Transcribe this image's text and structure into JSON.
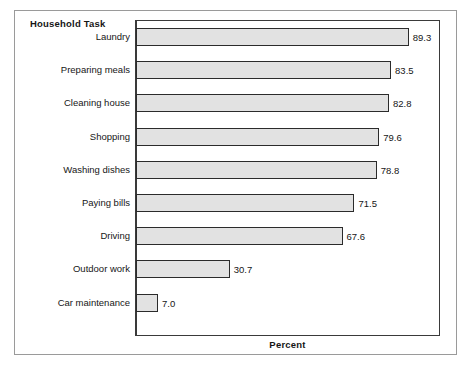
{
  "chart_data": {
    "type": "bar",
    "orientation": "horizontal",
    "title": "",
    "group_title": "Household Task",
    "xlabel": "Percent",
    "ylabel": "",
    "categories": [
      "Laundry",
      "Preparing meals",
      "Cleaning house",
      "Shopping",
      "Washing dishes",
      "Paying bills",
      "Driving",
      "Outdoor work",
      "Car maintenance"
    ],
    "values": [
      89.3,
      83.5,
      82.8,
      79.6,
      78.8,
      71.5,
      67.6,
      30.7,
      7.0
    ],
    "value_labels": [
      "89.3",
      "83.5",
      "82.8",
      "79.6",
      "78.8",
      "71.5",
      "67.6",
      "30.7",
      "7.0"
    ],
    "xlim": [
      0,
      100
    ],
    "grid": false,
    "legend": false,
    "bar_fill_color": "#e2e2e2",
    "bar_border_color": "#2b2b2b",
    "axis_color": "#3a3a3a",
    "frame_color": "#9a9a9a",
    "text_color": "#161616"
  }
}
